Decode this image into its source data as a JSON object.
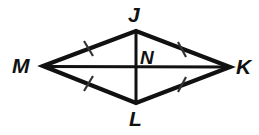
{
  "figure": {
    "type": "geometry-diagram",
    "shape": "rhombus",
    "stroke_color": "#111111",
    "background_color": "#ffffff",
    "labels": {
      "top": "J",
      "left": "M",
      "right": "K",
      "bottom": "L",
      "center": "N"
    },
    "vertices": {
      "J": {
        "x": 136,
        "y": 31
      },
      "K": {
        "x": 230,
        "y": 67
      },
      "L": {
        "x": 136,
        "y": 103
      },
      "M": {
        "x": 43,
        "y": 66
      },
      "N": {
        "x": 136,
        "y": 67
      }
    },
    "sides": [
      {
        "name": "MJ",
        "from": "M",
        "to": "J",
        "tick_marks": 1
      },
      {
        "name": "JK",
        "from": "J",
        "to": "K",
        "tick_marks": 1
      },
      {
        "name": "KL",
        "from": "K",
        "to": "L",
        "tick_marks": 1
      },
      {
        "name": "LM",
        "from": "L",
        "to": "M",
        "tick_marks": 1
      }
    ],
    "diagonals": [
      {
        "name": "MK",
        "from": "M",
        "to": "K"
      },
      {
        "name": "JL",
        "from": "J",
        "to": "L"
      }
    ],
    "watermark_text": ""
  }
}
